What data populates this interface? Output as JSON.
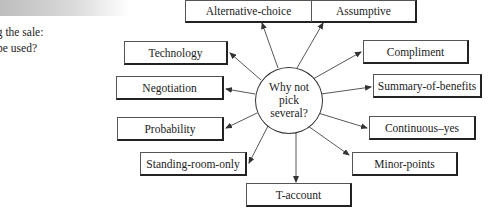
{
  "side_question": {
    "lines": [
      "ng the sale:",
      "l be used?"
    ]
  },
  "hub": {
    "lines": [
      "Why not",
      "pick",
      "several?"
    ]
  },
  "techniques": [
    {
      "id": "alternative-choice",
      "label": "Alternative-choice"
    },
    {
      "id": "assumptive",
      "label": "Assumptive"
    },
    {
      "id": "technology",
      "label": "Technology"
    },
    {
      "id": "compliment",
      "label": "Compliment"
    },
    {
      "id": "negotiation",
      "label": "Negotiation"
    },
    {
      "id": "summary-of-benefits",
      "label": "Summary-of-benefits"
    },
    {
      "id": "probability",
      "label": "Probability"
    },
    {
      "id": "continuous-yes",
      "label": "Continuous–yes"
    },
    {
      "id": "standing-room-only",
      "label": "Standing-room-only"
    },
    {
      "id": "minor-points",
      "label": "Minor-points"
    },
    {
      "id": "t-account",
      "label": "T-account"
    }
  ],
  "colors": {
    "line": "#444444",
    "box_border": "#222222",
    "header_band": "#bdbdbd"
  }
}
